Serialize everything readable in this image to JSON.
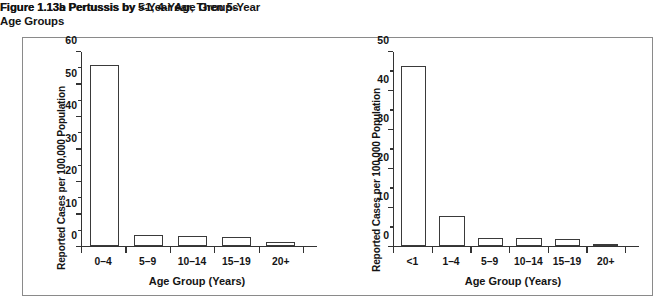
{
  "figure": {
    "title_a": "Figure 1.13a Pertussis by 5-Year Age Groups",
    "title_b": "Figure 1.13b Pertussis by <1, 4-Year, Then 5-Year\nAge Groups"
  },
  "chart_data": [
    {
      "type": "bar",
      "id": "chart-a",
      "title": "Figure 1.13a Pertussis by 5-Year Age Groups",
      "xlabel": "Age Group (Years)",
      "ylabel": "Reported Cases per 100,000 Population",
      "categories": [
        "0–4",
        "5–9",
        "10–14",
        "15–19",
        "20+"
      ],
      "values": [
        55.5,
        3.2,
        3.0,
        2.7,
        1.0
      ],
      "ylim": [
        0,
        60
      ],
      "yticks": [
        0,
        10,
        20,
        30,
        40,
        50,
        60
      ],
      "ytick_labels": [
        "0",
        "10",
        "20",
        "30",
        "40",
        "50",
        "60"
      ],
      "grid": false,
      "legend": "none",
      "bar_fill": "#ffffff",
      "bar_stroke": "#3a3a3a"
    },
    {
      "type": "bar",
      "id": "chart-b",
      "title": "Figure 1.13b Pertussis by <1, 4-Year, Then 5-Year Age Groups",
      "xlabel": "Age Group (Years)",
      "ylabel": "Reported Cases per 100,000 Population",
      "categories": [
        "<1",
        "1–4",
        "5–9",
        "10–14",
        "15–19",
        "20+"
      ],
      "values": [
        46.0,
        7.5,
        2.1,
        2.0,
        1.7,
        0.4
      ],
      "ylim": [
        0,
        50
      ],
      "yticks": [
        0,
        10,
        20,
        30,
        40,
        50
      ],
      "ytick_labels": [
        "0",
        "10",
        "20",
        "30",
        "40",
        "50"
      ],
      "grid": false,
      "legend": "none",
      "bar_fill": "#ffffff",
      "bar_stroke": "#3a3a3a"
    }
  ]
}
